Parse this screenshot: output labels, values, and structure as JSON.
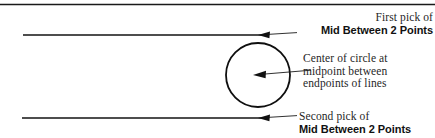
{
  "figure": {
    "background_color": "#ffffff",
    "ink_color": "#111111",
    "top_rule": {
      "present": true,
      "x1": 0,
      "x2": 435,
      "y": 4
    },
    "lines": [
      {
        "name": "upper-line",
        "x1": 23,
        "y1": 35,
        "x2": 262,
        "y2": 35
      },
      {
        "name": "lower-line",
        "x1": 22,
        "y1": 118,
        "x2": 262,
        "y2": 118
      }
    ],
    "circle": {
      "name": "construction-circle",
      "cx": 258,
      "cy": 75,
      "r": 32
    },
    "arrows": [
      {
        "name": "arrow-first-pick",
        "tip_x": 258,
        "tip_y": 35,
        "tail_x": 297,
        "tail_y": 33
      },
      {
        "name": "arrow-circle-center",
        "tip_x": 253,
        "tip_y": 75,
        "tail_x": 311,
        "tail_y": 70
      },
      {
        "name": "arrow-second-pick",
        "tip_x": 258,
        "tip_y": 118,
        "tail_x": 297,
        "tail_y": 116
      }
    ]
  },
  "callouts": {
    "first_pick": {
      "line1": "First pick of",
      "line2": "Mid Between 2 Points"
    },
    "circle_center": {
      "line1": "Center of circle at",
      "line2": "midpoint between",
      "line3": "endpoints of lines"
    },
    "second_pick": {
      "line1": "Second pick of",
      "line2": "Mid Between 2 Points"
    }
  }
}
